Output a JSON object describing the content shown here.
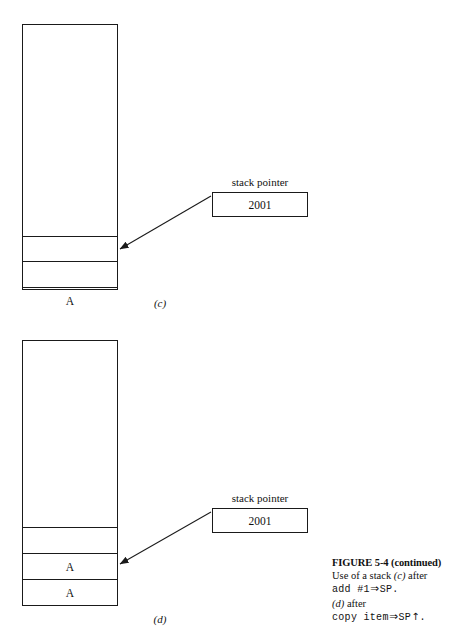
{
  "figure": {
    "panels": [
      {
        "id": "c",
        "sublabel": "(c)",
        "stack": {
          "cells": [
            {
              "value": "",
              "name": "empty-region"
            },
            {
              "value": "",
              "name": "empty-slot"
            },
            {
              "value": "",
              "name": "empty-slot"
            },
            {
              "value": "A",
              "name": "stack-entry"
            }
          ]
        },
        "pointer": {
          "label": "stack pointer",
          "value": "2001"
        }
      },
      {
        "id": "d",
        "sublabel": "(d)",
        "stack": {
          "cells": [
            {
              "value": "",
              "name": "empty-region"
            },
            {
              "value": "",
              "name": "empty-slot"
            },
            {
              "value": "A",
              "name": "stack-entry"
            },
            {
              "value": "A",
              "name": "stack-entry"
            }
          ]
        },
        "pointer": {
          "label": "stack pointer",
          "value": "2001"
        }
      }
    ],
    "caption": {
      "title": "FIGURE 5-4 (continued)",
      "line1_pre": "Use of a stack ",
      "line1_italic": "(c)",
      "line1_post": " after",
      "line2_code": "add #1",
      "line2_arrow": "⇒",
      "line2_tail": "SP.",
      "line3_italic": "(d)",
      "line3_post": " after",
      "line4_code": "copy item",
      "line4_arrow": "⇒",
      "line4_tail": "SP",
      "line4_up": "↑",
      "line4_period": "."
    }
  },
  "colors": {
    "stroke": "#1a1a1a",
    "background": "#ffffff",
    "text": "#111111"
  }
}
